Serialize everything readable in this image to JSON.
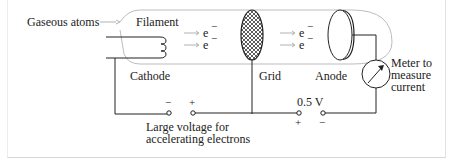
{
  "diagram": {
    "labels": {
      "gaseous_atoms": "Gaseous atoms",
      "filament": "Filament",
      "cathode": "Cathode",
      "grid": "Grid",
      "anode": "Anode",
      "meter_line1": "Meter to",
      "meter_line2": "measure",
      "meter_line3": "current",
      "large_voltage_line1": "Large voltage for",
      "large_voltage_line2": "accelerating electrons",
      "small_voltage": "0.5 V"
    },
    "electrons": {
      "symbol": "e",
      "charge": "−"
    },
    "polarity": {
      "left_source_left": "−",
      "left_source_right": "+",
      "right_source_left": "+",
      "right_source_right": "−"
    },
    "colors": {
      "line": "#222222",
      "tube": "#b8b8b8",
      "arrow": "#a0a0a0"
    }
  }
}
